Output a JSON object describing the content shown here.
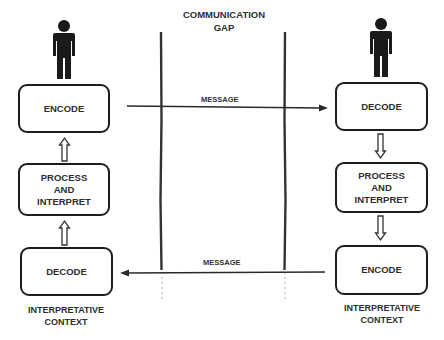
{
  "title": "COMMUNICATION\nGAP",
  "title_lines": [
    "COMMUNICATION",
    "GAP"
  ],
  "left": {
    "person_icon": "person-icon",
    "boxes": [
      {
        "label": "ENCODE"
      },
      {
        "label_lines": [
          "PROCESS",
          "AND",
          "INTERPRET"
        ]
      },
      {
        "label": "DECODE"
      }
    ],
    "context_lines": [
      "INTERPRETATIVE",
      "CONTEXT"
    ],
    "flow_arrows": [
      "up",
      "up"
    ]
  },
  "right": {
    "person_icon": "person-icon",
    "boxes": [
      {
        "label": "DECODE"
      },
      {
        "label_lines": [
          "PROCESS",
          "AND",
          "INTERPRET"
        ]
      },
      {
        "label": "ENCODE"
      }
    ],
    "context_lines": [
      "INTERPRETATIVE",
      "CONTEXT"
    ],
    "flow_arrows": [
      "down",
      "down"
    ]
  },
  "messages": [
    {
      "label": "MESSAGE",
      "direction": "left-to-right"
    },
    {
      "label": "MESSAGE",
      "direction": "right-to-left"
    }
  ],
  "colors": {
    "ink": "#1e1e1e",
    "text": "#2e2e2e",
    "background": "#ffffff"
  }
}
